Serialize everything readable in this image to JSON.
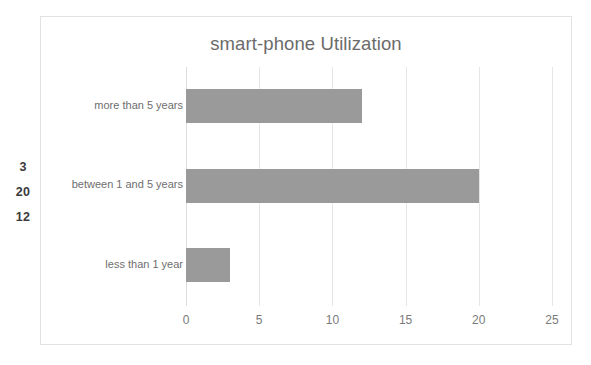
{
  "chart_data": {
    "type": "bar",
    "orientation": "horizontal",
    "title": "smart-phone Utilization",
    "xlabel": "",
    "ylabel": "",
    "categories": [
      "less than 1 year",
      "between 1 and 5 years",
      "more than 5 years"
    ],
    "values": [
      3,
      20,
      12
    ],
    "xlim": [
      0,
      25
    ],
    "xticks": [
      0,
      5,
      10,
      15,
      20,
      25
    ],
    "xtick_labels": [
      "0",
      "5",
      "10",
      "15",
      "20",
      "25"
    ],
    "grid": true,
    "grid_axis": "x",
    "legend": false,
    "bar_color": "#9a9a9a",
    "gridline_color": "#e6e6e6",
    "title_color": "#6b6b6b",
    "label_color": "#6e6e6e",
    "frame_border_color": "#e2e2e2",
    "background": "#ffffff"
  },
  "side_values": {
    "label": "",
    "items": [
      "3",
      "20",
      "12"
    ]
  }
}
